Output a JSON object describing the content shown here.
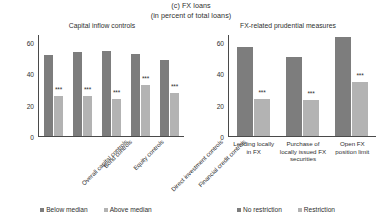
{
  "figure": {
    "title_line1": "(c) FX loans",
    "title_line2": "(in percent of total loans)"
  },
  "chart_data": [
    {
      "type": "bar",
      "title": "Capital inflow controls",
      "xlabel": "",
      "ylabel": "",
      "ylim": [
        0,
        65
      ],
      "yticks": [
        "0",
        "20",
        "40",
        "60"
      ],
      "grid": false,
      "legend_position": "bottom",
      "categories": [
        "Overall capital controls",
        "Bond controls",
        "Equity controls",
        "Direct investment controls",
        "Financial credit controls"
      ],
      "series": [
        {
          "name": "Below median",
          "color": "#7d7d7d",
          "values": [
            52,
            54,
            55,
            53,
            49
          ]
        },
        {
          "name": "Above median",
          "color": "#b3b3b3",
          "values": [
            26,
            26,
            24,
            33,
            28
          ]
        }
      ],
      "annotations": [
        "***",
        "***",
        "***",
        "***",
        "***"
      ]
    },
    {
      "type": "bar",
      "title": "FX-related prudential measures",
      "xlabel": "",
      "ylabel": "",
      "ylim": [
        0,
        65
      ],
      "yticks": [
        "0",
        "20",
        "40",
        "60"
      ],
      "grid": false,
      "legend_position": "bottom",
      "categories": [
        "Lending locally in FX",
        "Purchase of locally issued FX securities",
        "Open FX position limit"
      ],
      "series": [
        {
          "name": "No restriction",
          "color": "#7d7d7d",
          "values": [
            57,
            51,
            64
          ]
        },
        {
          "name": "Restriction",
          "color": "#b3b3b3",
          "values": [
            24,
            23,
            35
          ]
        }
      ],
      "annotations": [
        "***",
        "***",
        "***"
      ]
    }
  ],
  "left": {
    "title": "Capital inflow controls",
    "yticks": [
      "60",
      "40",
      "20",
      "0"
    ],
    "categories": [
      "Overall capital controls",
      "Bond controls",
      "Equity controls",
      "Direct investment controls",
      "Financial credit controls"
    ],
    "bars": [
      {
        "dark": 52,
        "light": 26,
        "sig": "***"
      },
      {
        "dark": 54,
        "light": 26,
        "sig": "***"
      },
      {
        "dark": 55,
        "light": 24,
        "sig": "***"
      },
      {
        "dark": 53,
        "light": 33,
        "sig": "***"
      },
      {
        "dark": 49,
        "light": 28,
        "sig": "***"
      }
    ],
    "legend": [
      {
        "label": "Below median",
        "color": "#7d7d7d"
      },
      {
        "label": "Above median",
        "color": "#b3b3b3"
      }
    ]
  },
  "right": {
    "title": "FX-related prudential measures",
    "yticks": [
      "60",
      "40",
      "20",
      "0"
    ],
    "categories": [
      "Lending locally in FX",
      "Purchase of locally issued FX securities",
      "Open FX position limit"
    ],
    "bars": [
      {
        "dark": 57,
        "light": 24,
        "sig": "***"
      },
      {
        "dark": 51,
        "light": 23,
        "sig": "***"
      },
      {
        "dark": 64,
        "light": 35,
        "sig": "***"
      }
    ],
    "legend": [
      {
        "label": "No restriction",
        "color": "#7d7d7d"
      },
      {
        "label": "Restriction",
        "color": "#b3b3b3"
      }
    ]
  }
}
